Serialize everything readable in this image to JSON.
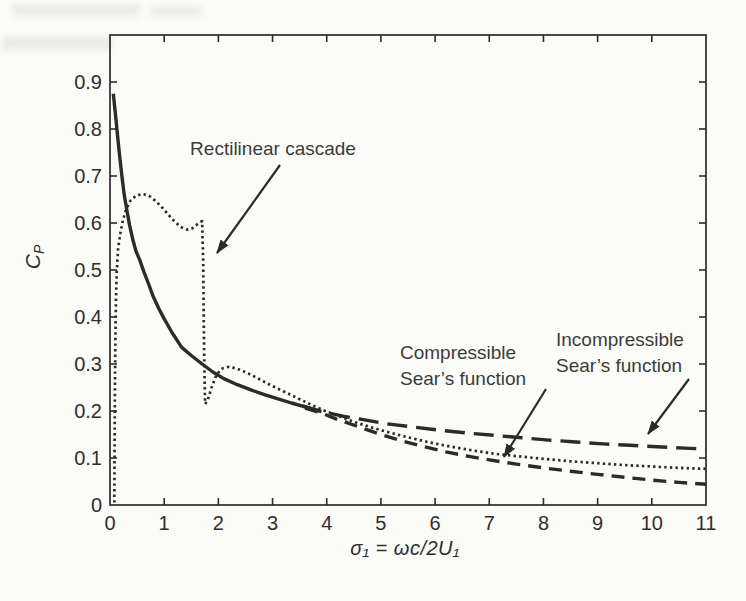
{
  "figure": {
    "background_color": "#fbfbf8",
    "ink_color": "#2b2b2b",
    "text_color": "#3b3b3b"
  },
  "chart_data": {
    "type": "line",
    "title": "",
    "xlabel": "σ₁ = ωc/2U₁",
    "ylabel_main": "C",
    "ylabel_sub": "P",
    "xlim": [
      0,
      11
    ],
    "ylim": [
      0,
      1.0
    ],
    "grid": false,
    "legend_position": "none",
    "xticks": [
      0,
      1,
      2,
      3,
      4,
      5,
      6,
      7,
      8,
      9,
      10,
      11
    ],
    "xtick_labels": [
      "0",
      "1",
      "2",
      "3",
      "4",
      "5",
      "6",
      "7",
      "8",
      "9",
      "10",
      "11"
    ],
    "yticks": [
      0,
      0.1,
      0.2,
      0.3,
      0.4,
      0.5,
      0.6,
      0.7,
      0.8,
      0.9
    ],
    "ytick_labels": [
      "0",
      "0.1",
      "0.2",
      "0.3",
      "0.4",
      "0.5",
      "0.6",
      "0.7",
      "0.8",
      "0.9"
    ],
    "series": [
      {
        "name": "Merged Sears functions (low reduced frequency)",
        "style": "solid",
        "points": [
          [
            0.06,
            0.875
          ],
          [
            0.08,
            0.855
          ],
          [
            0.11,
            0.82
          ],
          [
            0.14,
            0.785
          ],
          [
            0.18,
            0.74
          ],
          [
            0.22,
            0.7
          ],
          [
            0.26,
            0.662
          ],
          [
            0.31,
            0.628
          ],
          [
            0.36,
            0.596
          ],
          [
            0.42,
            0.565
          ],
          [
            0.48,
            0.54
          ],
          [
            0.55,
            0.521
          ],
          [
            0.63,
            0.495
          ],
          [
            0.72,
            0.468
          ],
          [
            0.8,
            0.443
          ],
          [
            0.9,
            0.418
          ],
          [
            1.0,
            0.396
          ],
          [
            1.15,
            0.366
          ],
          [
            1.32,
            0.336
          ],
          [
            1.5,
            0.318
          ],
          [
            1.7,
            0.3
          ],
          [
            1.9,
            0.283
          ],
          [
            2.1,
            0.269
          ],
          [
            2.35,
            0.256
          ],
          [
            2.6,
            0.245
          ],
          [
            2.85,
            0.235
          ],
          [
            3.1,
            0.226
          ],
          [
            3.35,
            0.217
          ],
          [
            3.6,
            0.209
          ],
          [
            3.85,
            0.2
          ]
        ]
      },
      {
        "name": "Incompressible Sear's function",
        "style": "long-dash",
        "points": [
          [
            3.55,
            0.211
          ],
          [
            3.9,
            0.199
          ],
          [
            4.3,
            0.189
          ],
          [
            4.7,
            0.181
          ],
          [
            5.1,
            0.173
          ],
          [
            5.6,
            0.166
          ],
          [
            6.1,
            0.159
          ],
          [
            6.6,
            0.153
          ],
          [
            7.1,
            0.148
          ],
          [
            7.6,
            0.143
          ],
          [
            8.1,
            0.138
          ],
          [
            8.6,
            0.134
          ],
          [
            9.1,
            0.13
          ],
          [
            9.6,
            0.127
          ],
          [
            10.1,
            0.124
          ],
          [
            10.6,
            0.121
          ],
          [
            11.0,
            0.119
          ]
        ]
      },
      {
        "name": "Compressible Sear's function",
        "style": "short-dash",
        "points": [
          [
            3.6,
            0.206
          ],
          [
            3.9,
            0.196
          ],
          [
            4.2,
            0.182
          ],
          [
            4.6,
            0.166
          ],
          [
            5.0,
            0.15
          ],
          [
            5.4,
            0.136
          ],
          [
            5.8,
            0.124
          ],
          [
            6.2,
            0.113
          ],
          [
            6.6,
            0.104
          ],
          [
            7.0,
            0.096
          ],
          [
            7.5,
            0.087
          ],
          [
            8.0,
            0.079
          ],
          [
            8.5,
            0.072
          ],
          [
            9.0,
            0.065
          ],
          [
            9.5,
            0.059
          ],
          [
            10.0,
            0.053
          ],
          [
            10.5,
            0.048
          ],
          [
            11.0,
            0.044
          ]
        ]
      },
      {
        "name": "Rectilinear cascade",
        "style": "dotted",
        "points": [
          [
            0.08,
            0.005
          ],
          [
            0.085,
            0.12
          ],
          [
            0.09,
            0.24
          ],
          [
            0.1,
            0.36
          ],
          [
            0.11,
            0.44
          ],
          [
            0.125,
            0.5
          ],
          [
            0.15,
            0.545
          ],
          [
            0.19,
            0.578
          ],
          [
            0.24,
            0.607
          ],
          [
            0.3,
            0.63
          ],
          [
            0.38,
            0.648
          ],
          [
            0.48,
            0.658
          ],
          [
            0.6,
            0.662
          ],
          [
            0.72,
            0.658
          ],
          [
            0.85,
            0.646
          ],
          [
            1.0,
            0.628
          ],
          [
            1.15,
            0.608
          ],
          [
            1.3,
            0.592
          ],
          [
            1.42,
            0.586
          ],
          [
            1.52,
            0.589
          ],
          [
            1.62,
            0.598
          ],
          [
            1.7,
            0.604
          ],
          [
            1.72,
            0.52
          ],
          [
            1.73,
            0.4
          ],
          [
            1.74,
            0.3
          ],
          [
            1.755,
            0.215
          ],
          [
            1.8,
            0.222
          ],
          [
            1.88,
            0.252
          ],
          [
            1.97,
            0.278
          ],
          [
            2.08,
            0.291
          ],
          [
            2.2,
            0.294
          ],
          [
            2.35,
            0.29
          ],
          [
            2.55,
            0.28
          ],
          [
            2.75,
            0.268
          ],
          [
            2.95,
            0.256
          ],
          [
            3.2,
            0.242
          ],
          [
            3.45,
            0.228
          ],
          [
            3.7,
            0.214
          ],
          [
            3.95,
            0.201
          ],
          [
            4.2,
            0.19
          ],
          [
            4.5,
            0.177
          ],
          [
            4.8,
            0.166
          ],
          [
            5.1,
            0.156
          ],
          [
            5.5,
            0.144
          ],
          [
            5.9,
            0.133
          ],
          [
            6.3,
            0.124
          ],
          [
            6.7,
            0.116
          ],
          [
            7.1,
            0.109
          ],
          [
            7.5,
            0.104
          ],
          [
            8.0,
            0.098
          ],
          [
            8.5,
            0.093
          ],
          [
            9.0,
            0.089
          ],
          [
            9.5,
            0.085
          ],
          [
            10.0,
            0.082
          ],
          [
            10.5,
            0.079
          ],
          [
            11.0,
            0.077
          ]
        ]
      }
    ],
    "annotations": [
      {
        "id": "rectilinear-cascade",
        "lines": [
          "Rectilinear cascade"
        ],
        "arrow": {
          "x1": 280,
          "y1": 165,
          "x2": 217,
          "y2": 253
        }
      },
      {
        "id": "compressible-sears",
        "lines": [
          "Compressible",
          "Sear’s function"
        ],
        "arrow": {
          "x1": 546,
          "y1": 389,
          "x2": 504,
          "y2": 457
        }
      },
      {
        "id": "incompressible-sears",
        "lines": [
          "Incompressible",
          "Sear’s function"
        ],
        "arrow": {
          "x1": 689,
          "y1": 379,
          "x2": 648,
          "y2": 434
        }
      }
    ]
  }
}
